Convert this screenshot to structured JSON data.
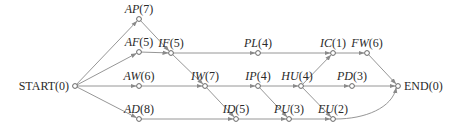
{
  "diagram": {
    "type": "activity-network",
    "nodes": [
      {
        "id": "START",
        "name": "START",
        "duration": "0",
        "italic": false
      },
      {
        "id": "AP",
        "name": "AP",
        "duration": "7",
        "italic": true
      },
      {
        "id": "AF",
        "name": "AF",
        "duration": "5",
        "italic": true
      },
      {
        "id": "AW",
        "name": "AW",
        "duration": "6",
        "italic": true
      },
      {
        "id": "AD",
        "name": "AD",
        "duration": "8",
        "italic": true
      },
      {
        "id": "IF",
        "name": "IF",
        "duration": "5",
        "italic": true
      },
      {
        "id": "IW",
        "name": "IW",
        "duration": "7",
        "italic": true
      },
      {
        "id": "ID",
        "name": "ID",
        "duration": "5",
        "italic": true
      },
      {
        "id": "PL",
        "name": "PL",
        "duration": "4",
        "italic": true
      },
      {
        "id": "IP",
        "name": "IP",
        "duration": "4",
        "italic": true
      },
      {
        "id": "PU",
        "name": "PU",
        "duration": "3",
        "italic": true
      },
      {
        "id": "HU",
        "name": "HU",
        "duration": "4",
        "italic": true
      },
      {
        "id": "IC",
        "name": "IC",
        "duration": "1",
        "italic": true
      },
      {
        "id": "PD",
        "name": "PD",
        "duration": "3",
        "italic": true
      },
      {
        "id": "EU",
        "name": "EU",
        "duration": "2",
        "italic": true
      },
      {
        "id": "FW",
        "name": "FW",
        "duration": "6",
        "italic": true
      },
      {
        "id": "END",
        "name": "END",
        "duration": "0",
        "italic": false
      }
    ],
    "edges": [
      {
        "from": "START",
        "to": "AP"
      },
      {
        "from": "START",
        "to": "AF"
      },
      {
        "from": "START",
        "to": "AW"
      },
      {
        "from": "START",
        "to": "AD"
      },
      {
        "from": "AP",
        "to": "IF"
      },
      {
        "from": "AF",
        "to": "IF"
      },
      {
        "from": "IF",
        "to": "PL"
      },
      {
        "from": "IF",
        "to": "IW"
      },
      {
        "from": "AW",
        "to": "IW"
      },
      {
        "from": "IW",
        "to": "IP"
      },
      {
        "from": "IW",
        "to": "ID"
      },
      {
        "from": "AD",
        "to": "ID"
      },
      {
        "from": "ID",
        "to": "PU"
      },
      {
        "from": "IP",
        "to": "HU"
      },
      {
        "from": "IP",
        "to": "PU"
      },
      {
        "from": "PL",
        "to": "IC"
      },
      {
        "from": "HU",
        "to": "IC"
      },
      {
        "from": "HU",
        "to": "PD"
      },
      {
        "from": "HU",
        "to": "EU"
      },
      {
        "from": "PU",
        "to": "EU"
      },
      {
        "from": "IC",
        "to": "FW"
      },
      {
        "from": "FW",
        "to": "END"
      },
      {
        "from": "PD",
        "to": "END"
      },
      {
        "from": "EU",
        "to": "END",
        "curved": true
      }
    ],
    "colors": {
      "edge": "#8a8a8a",
      "node": "#555555",
      "text": "#2a2a2a"
    }
  }
}
